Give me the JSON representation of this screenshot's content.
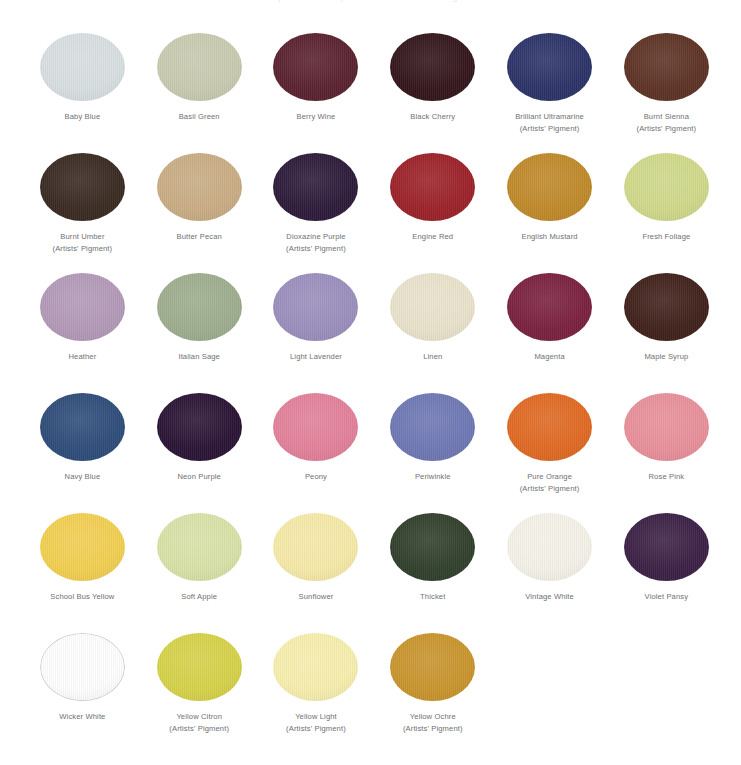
{
  "page": {
    "title_clipped": "Complete FolkArt Acrylic Color Chart with Artists' Pigments",
    "background": "#ffffff",
    "label_color": "#6f6f74",
    "columns": 6,
    "rows": 6
  },
  "swatches": [
    {
      "name": "Baby Blue",
      "sub": "",
      "color": "#d8dfe0",
      "outlined": false
    },
    {
      "name": "Basil Green",
      "sub": "",
      "color": "#c8cbb0",
      "outlined": false
    },
    {
      "name": "Berry Wine",
      "sub": "",
      "color": "#5a2230",
      "outlined": false
    },
    {
      "name": "Black Cherry",
      "sub": "",
      "color": "#33161c",
      "outlined": false
    },
    {
      "name": "Brilliant Ultramarine",
      "sub": "(Artists' Pigment)",
      "color": "#2c3468",
      "outlined": false
    },
    {
      "name": "Burnt Sienna",
      "sub": "(Artists' Pigment)",
      "color": "#5d3325",
      "outlined": false
    },
    {
      "name": "Burnt Umber",
      "sub": "(Artists' Pigment)",
      "color": "#3a2a22",
      "outlined": false
    },
    {
      "name": "Butter Pecan",
      "sub": "",
      "color": "#c9ad85",
      "outlined": false
    },
    {
      "name": "Dioxazine Purple",
      "sub": "(Artists' Pigment)",
      "color": "#2d1b3a",
      "outlined": false
    },
    {
      "name": "Engine Red",
      "sub": "",
      "color": "#9c2229",
      "outlined": false
    },
    {
      "name": "English Mustard",
      "sub": "",
      "color": "#c08a2a",
      "outlined": false
    },
    {
      "name": "Fresh Foliage",
      "sub": "",
      "color": "#cfd98a",
      "outlined": false
    },
    {
      "name": "Heather",
      "sub": "",
      "color": "#b39ab8",
      "outlined": false
    },
    {
      "name": "Italian Sage",
      "sub": "",
      "color": "#9eae8e",
      "outlined": false
    },
    {
      "name": "Light Lavender",
      "sub": "",
      "color": "#9b8fbd",
      "outlined": false
    },
    {
      "name": "Linen",
      "sub": "",
      "color": "#e9e2cc",
      "outlined": false
    },
    {
      "name": "Magenta",
      "sub": "",
      "color": "#7a2140",
      "outlined": false
    },
    {
      "name": "Maple Syrup",
      "sub": "",
      "color": "#41211b",
      "outlined": false
    },
    {
      "name": "Navy Blue",
      "sub": "",
      "color": "#2f4d7a",
      "outlined": false
    },
    {
      "name": "Neon Purple",
      "sub": "",
      "color": "#2b1435",
      "outlined": false
    },
    {
      "name": "Peony",
      "sub": "",
      "color": "#e2819a",
      "outlined": false
    },
    {
      "name": "Periwinkle",
      "sub": "",
      "color": "#6f78b4",
      "outlined": false
    },
    {
      "name": "Pure Orange",
      "sub": "(Artists' Pigment)",
      "color": "#e06a23",
      "outlined": false
    },
    {
      "name": "Rose Pink",
      "sub": "",
      "color": "#e8909a",
      "outlined": false
    },
    {
      "name": "School Bus Yellow",
      "sub": "",
      "color": "#f2cf52",
      "outlined": false
    },
    {
      "name": "Soft Apple",
      "sub": "",
      "color": "#d9e2a8",
      "outlined": false
    },
    {
      "name": "Sunflower",
      "sub": "",
      "color": "#f6e9a8",
      "outlined": false
    },
    {
      "name": "Thicket",
      "sub": "",
      "color": "#31402c",
      "outlined": false
    },
    {
      "name": "Vintage White",
      "sub": "",
      "color": "#f4f2e8",
      "outlined": false
    },
    {
      "name": "Violet Pansy",
      "sub": "",
      "color": "#3c2145",
      "outlined": false
    },
    {
      "name": "Wicker White",
      "sub": "",
      "color": "#fefefe",
      "outlined": true
    },
    {
      "name": "Yellow Citron",
      "sub": "(Artists' Pigment)",
      "color": "#d6d24a",
      "outlined": false
    },
    {
      "name": "Yellow Light",
      "sub": "(Artists' Pigment)",
      "color": "#f7eeae",
      "outlined": false
    },
    {
      "name": "Yellow Ochre",
      "sub": "(Artists' Pigment)",
      "color": "#c9952e",
      "outlined": false
    }
  ]
}
